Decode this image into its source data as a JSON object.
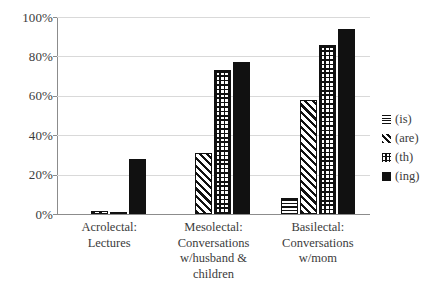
{
  "chart_data": {
    "type": "bar",
    "title": "",
    "subtitle": "",
    "xlabel": "",
    "ylabel": "",
    "ylim": [
      0,
      100
    ],
    "ytick_labels": [
      "100%",
      "80%",
      "60%",
      "40%",
      "20%",
      "0%"
    ],
    "ytick_values": [
      100,
      80,
      60,
      40,
      20,
      0
    ],
    "grid": true,
    "grid_axis": "y",
    "legend_position": "right",
    "value_unit": "%",
    "categories": [
      "Acrolectal: Lectures",
      "Mesolectal: Conversations w/husband & children",
      "Basilectal: Conversations w/mom"
    ],
    "category_lines": [
      [
        "Acrolectal:",
        "Lectures"
      ],
      [
        "Mesolectal:",
        "Conversations",
        "w/husband &",
        "children"
      ],
      [
        "Basilectal:",
        "Conversations",
        "w/mom"
      ]
    ],
    "series": [
      {
        "name": "(is)",
        "pattern": "horizontal-lines",
        "color": "#111111",
        "values": [
          0,
          0,
          8
        ]
      },
      {
        "name": "(are)",
        "pattern": "diagonal-hatch",
        "color": "#111111",
        "values": [
          1.5,
          31,
          58
        ]
      },
      {
        "name": "(th)",
        "pattern": "crosshatch",
        "color": "#111111",
        "values": [
          1,
          73,
          86
        ]
      },
      {
        "name": "(ing)",
        "pattern": "solid",
        "color": "#111111",
        "values": [
          28,
          77,
          94
        ]
      }
    ]
  },
  "legend": {
    "items": [
      {
        "label": "(is)",
        "pattern": "horizontal-lines"
      },
      {
        "label": "(are)",
        "pattern": "diagonal-hatch"
      },
      {
        "label": "(th)",
        "pattern": "crosshatch"
      },
      {
        "label": "(ing)",
        "pattern": "solid"
      }
    ]
  },
  "axis": {
    "y_ticks": [
      {
        "label": "100%",
        "value": 100
      },
      {
        "label": "80%",
        "value": 80
      },
      {
        "label": "60%",
        "value": 60
      },
      {
        "label": "40%",
        "value": 40
      },
      {
        "label": "20%",
        "value": 20
      },
      {
        "label": "0%",
        "value": 0
      }
    ]
  },
  "style": {
    "background": "#ffffff",
    "ink": "#3b3b3b",
    "bar_ink": "#111111",
    "gridline": "#d9d9d9",
    "axis_line": "#8c8c8c"
  }
}
